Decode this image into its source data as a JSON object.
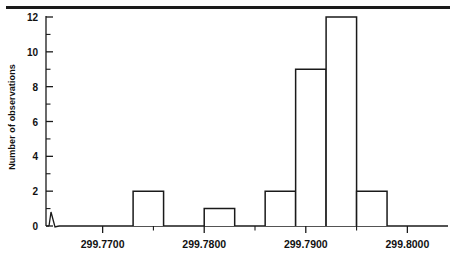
{
  "chart_data": {
    "type": "bar",
    "title": "",
    "subtitle": "",
    "xlabel": "",
    "ylabel": "Number of observations",
    "xlim": [
      299.766,
      299.804
    ],
    "ylim": [
      0,
      12
    ],
    "grid": false,
    "legend": null,
    "axis_break": true,
    "bar_style": "open-outline",
    "bin_width": 0.001,
    "x_tick_labels": [
      "299.7700",
      "299.7800",
      "299.7900",
      "299.8000"
    ],
    "x_tick_values": [
      299.77,
      299.78,
      299.79,
      299.8
    ],
    "x_minor_tick_values": [
      299.775,
      299.785,
      299.795
    ],
    "y_tick_labels": [
      "0",
      "2",
      "4",
      "6",
      "8",
      "10",
      "12"
    ],
    "y_tick_values": [
      0,
      2,
      4,
      6,
      8,
      10,
      12
    ],
    "y_minor_tick_values": [
      1,
      3,
      5,
      7,
      9,
      11
    ],
    "bin_left_edges": [
      299.773,
      299.78,
      299.786,
      299.789,
      299.792,
      299.795
    ],
    "bin_right_edges": [
      299.776,
      299.783,
      299.789,
      299.792,
      299.795,
      299.798
    ],
    "bin_centers": [
      299.7745,
      299.7815,
      299.7875,
      299.7905,
      299.7935,
      299.7965
    ],
    "values": [
      2,
      1,
      2,
      9,
      12,
      2
    ],
    "categories": [
      "299.7730–299.7760",
      "299.7800–299.7830",
      "299.7860–299.7890",
      "299.7890–299.7920",
      "299.7920–299.7950",
      "299.7950–299.7980"
    ],
    "total_observations": 28,
    "colors": {
      "axis": "#1a1a1a",
      "bar_outline": "#1a1a1a",
      "bar_fill": "#ffffff",
      "text": "#111111",
      "background": "#ffffff"
    }
  }
}
